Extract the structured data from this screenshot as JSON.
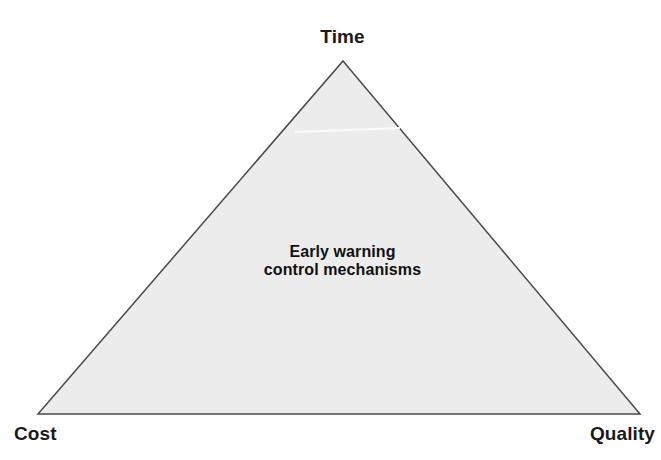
{
  "diagram": {
    "type": "triangle-tradeoff",
    "background_color": "#ffffff",
    "shape": {
      "name": "triangle",
      "fill_color": "#ececec",
      "stroke_color": "#4a4a4a",
      "stroke_width": 1.5,
      "vertices": {
        "apex": [
          343,
          61
        ],
        "bottom_left": [
          38,
          414
        ],
        "bottom_right": [
          640,
          414
        ]
      }
    },
    "vertex_labels": {
      "top": "Time",
      "bottom_left": "Cost",
      "bottom_right": "Quality"
    },
    "center_text": {
      "line1": "Early warning",
      "line2": "control mechanisms"
    },
    "artifact": {
      "name": "scan-streak",
      "color": "#fbfbfb",
      "x1": 295,
      "y1": 132,
      "x2": 400,
      "y2": 128
    }
  }
}
